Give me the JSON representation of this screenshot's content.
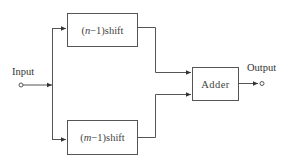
{
  "diagram": {
    "input_label": "Input",
    "output_label": "Output",
    "blocks": [
      {
        "id": "top_shift",
        "prefix": "(",
        "var": "n",
        "suffix": "−1)shift"
      },
      {
        "id": "bottom_shift",
        "prefix": "(",
        "var": "m",
        "suffix": "−1)shift"
      },
      {
        "id": "adder",
        "label": "Adder"
      }
    ],
    "colors": {
      "line": "#555555",
      "text": "#3a3a3a",
      "background": "#ffffff"
    }
  }
}
